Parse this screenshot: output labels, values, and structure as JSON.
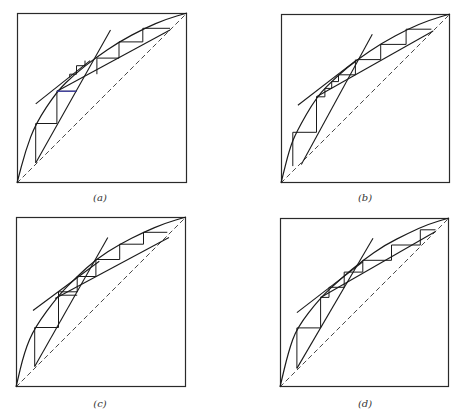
{
  "figure": {
    "colors": {
      "line": "#1a1a1a",
      "frame": "#2a2a2a",
      "dashed": "#333333",
      "accent": "#3b3bb0"
    },
    "panels": [
      {
        "id": "a",
        "label": "(a)",
        "frame": {
          "x": 17,
          "y": 13,
          "size": 170
        },
        "label_pos": {
          "x": 80,
          "y": 192
        },
        "curve": [
          [
            0,
            0
          ],
          [
            0.05,
            0.19
          ],
          [
            0.11,
            0.35
          ],
          [
            0.235,
            0.54
          ],
          [
            0.34,
            0.64
          ],
          [
            0.46,
            0.735
          ],
          [
            0.6,
            0.83
          ],
          [
            0.75,
            0.91
          ],
          [
            0.88,
            0.965
          ],
          [
            1,
            1
          ]
        ],
        "lines": [
          {
            "name": "stripping-operating-line",
            "pts": [
              [
                0.11,
                0.118
              ],
              [
                0.55,
                0.9
              ]
            ]
          },
          {
            "name": "pinch-tangent-line",
            "pts": [
              [
                0.11,
                0.465
              ],
              [
                0.43,
                0.72
              ]
            ]
          },
          {
            "name": "rectifying-operating-line",
            "pts": [
              [
                0.235,
                0.54
              ],
              [
                0.9,
                0.9
              ]
            ]
          }
        ],
        "steps": [
          [
            [
              0.11,
              0.118
            ],
            [
              0.11,
              0.35
            ],
            [
              0.235,
              0.35
            ],
            [
              0.235,
              0.54
            ],
            [
              0.35,
              0.54
            ]
          ],
          [
            [
              0.31,
              0.62
            ],
            [
              0.31,
              0.64
            ],
            [
              0.35,
              0.64
            ],
            [
              0.35,
              0.69
            ],
            [
              0.4,
              0.69
            ],
            [
              0.4,
              0.72
            ]
          ],
          [
            [
              0.47,
              0.64
            ],
            [
              0.47,
              0.735
            ],
            [
              0.6,
              0.735
            ],
            [
              0.6,
              0.83
            ],
            [
              0.74,
              0.83
            ],
            [
              0.74,
              0.91
            ],
            [
              0.9,
              0.91
            ]
          ]
        ],
        "accent_segment": [
          [
            0.235,
            0.54
          ],
          [
            0.35,
            0.54
          ]
        ]
      },
      {
        "id": "b",
        "label": "(b)",
        "frame": {
          "x": 281,
          "y": 14,
          "size": 169
        },
        "label_pos": {
          "x": 345,
          "y": 192
        },
        "curve": [
          [
            0,
            0
          ],
          [
            0.05,
            0.2
          ],
          [
            0.09,
            0.3
          ],
          [
            0.21,
            0.51
          ],
          [
            0.33,
            0.63
          ],
          [
            0.45,
            0.73
          ],
          [
            0.6,
            0.83
          ],
          [
            0.75,
            0.91
          ],
          [
            0.88,
            0.965
          ],
          [
            1,
            1
          ]
        ],
        "lines": [
          {
            "name": "stripping-operating-line",
            "pts": [
              [
                0.12,
                0.11
              ],
              [
                0.54,
                0.88
              ]
            ]
          },
          {
            "name": "pinch-tangent-line",
            "pts": [
              [
                0.1,
                0.46
              ],
              [
                0.45,
                0.73
              ]
            ]
          },
          {
            "name": "rectifying-operating-line",
            "pts": [
              [
                0.21,
                0.51
              ],
              [
                0.9,
                0.9
              ]
            ]
          }
        ],
        "steps": [
          [
            [
              0.07,
              0.1
            ],
            [
              0.07,
              0.3
            ],
            [
              0.21,
              0.3
            ],
            [
              0.21,
              0.51
            ],
            [
              0.26,
              0.51
            ],
            [
              0.26,
              0.56
            ]
          ],
          [
            [
              0.26,
              0.56
            ],
            [
              0.3,
              0.56
            ],
            [
              0.3,
              0.6
            ],
            [
              0.34,
              0.6
            ],
            [
              0.34,
              0.64
            ],
            [
              0.44,
              0.64
            ],
            [
              0.44,
              0.73
            ]
          ],
          [
            [
              0.45,
              0.73
            ],
            [
              0.59,
              0.73
            ],
            [
              0.59,
              0.82
            ],
            [
              0.74,
              0.82
            ],
            [
              0.74,
              0.91
            ],
            [
              0.89,
              0.91
            ]
          ]
        ]
      },
      {
        "id": "c",
        "label": "(c)",
        "frame": {
          "x": 16,
          "y": 217,
          "size": 170
        },
        "label_pos": {
          "x": 80,
          "y": 398
        },
        "curve": [
          [
            0,
            0
          ],
          [
            0.05,
            0.21
          ],
          [
            0.11,
            0.35
          ],
          [
            0.25,
            0.54
          ],
          [
            0.36,
            0.65
          ],
          [
            0.47,
            0.75
          ],
          [
            0.61,
            0.84
          ],
          [
            0.75,
            0.91
          ],
          [
            0.88,
            0.965
          ],
          [
            1,
            1
          ]
        ],
        "lines": [
          {
            "name": "stripping-operating-line",
            "pts": [
              [
                0.11,
                0.12
              ],
              [
                0.54,
                0.88
              ]
            ]
          },
          {
            "name": "pinch-tangent-line",
            "pts": [
              [
                0.1,
                0.45
              ],
              [
                0.49,
                0.74
              ]
            ]
          },
          {
            "name": "rectifying-operating-line",
            "pts": [
              [
                0.23,
                0.52
              ],
              [
                0.9,
                0.88
              ]
            ]
          }
        ],
        "steps": [
          [
            [
              0.11,
              0.12
            ],
            [
              0.11,
              0.35
            ],
            [
              0.25,
              0.35
            ],
            [
              0.25,
              0.54
            ],
            [
              0.36,
              0.54
            ]
          ],
          [
            [
              0.25,
              0.54
            ],
            [
              0.25,
              0.56
            ],
            [
              0.36,
              0.56
            ],
            [
              0.36,
              0.65
            ],
            [
              0.47,
              0.65
            ],
            [
              0.47,
              0.75
            ]
          ],
          [
            [
              0.47,
              0.75
            ],
            [
              0.61,
              0.75
            ],
            [
              0.61,
              0.84
            ],
            [
              0.75,
              0.84
            ],
            [
              0.75,
              0.91
            ],
            [
              0.89,
              0.91
            ]
          ]
        ]
      },
      {
        "id": "d",
        "label": "(d)",
        "frame": {
          "x": 280,
          "y": 218,
          "size": 169
        },
        "label_pos": {
          "x": 345,
          "y": 398
        },
        "curve": [
          [
            0,
            0
          ],
          [
            0.05,
            0.21
          ],
          [
            0.1,
            0.35
          ],
          [
            0.24,
            0.53
          ],
          [
            0.36,
            0.64
          ],
          [
            0.49,
            0.75
          ],
          [
            0.62,
            0.84
          ],
          [
            0.76,
            0.91
          ],
          [
            0.88,
            0.965
          ],
          [
            1,
            1
          ]
        ],
        "lines": [
          {
            "name": "stripping-operating-line",
            "pts": [
              [
                0.1,
                0.11
              ],
              [
                0.55,
                0.88
              ]
            ]
          },
          {
            "name": "pinch-tangent-line",
            "pts": [
              [
                0.1,
                0.44
              ],
              [
                0.49,
                0.74
              ]
            ]
          },
          {
            "name": "rectifying-operating-line",
            "pts": [
              [
                0.24,
                0.53
              ],
              [
                0.92,
                0.92
              ]
            ]
          }
        ],
        "steps": [
          [
            [
              0.1,
              0.11
            ],
            [
              0.1,
              0.35
            ],
            [
              0.24,
              0.35
            ],
            [
              0.24,
              0.53
            ],
            [
              0.29,
              0.53
            ],
            [
              0.29,
              0.59
            ]
          ],
          [
            [
              0.29,
              0.59
            ],
            [
              0.38,
              0.59
            ],
            [
              0.38,
              0.68
            ],
            [
              0.49,
              0.68
            ],
            [
              0.49,
              0.75
            ]
          ],
          [
            [
              0.49,
              0.75
            ],
            [
              0.66,
              0.75
            ],
            [
              0.66,
              0.84
            ],
            [
              0.83,
              0.84
            ],
            [
              0.83,
              0.93
            ],
            [
              0.92,
              0.93
            ]
          ]
        ]
      }
    ]
  }
}
